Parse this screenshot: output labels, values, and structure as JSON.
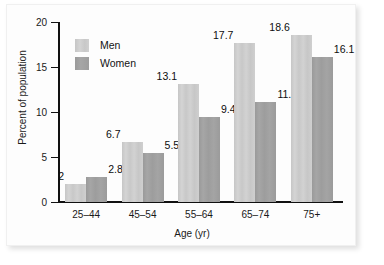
{
  "chart_data": {
    "type": "bar",
    "title": "",
    "subtitle": "",
    "xlabel": "Age (yr)",
    "ylabel": "Percent of population",
    "categories": [
      "25–44",
      "45–54",
      "55–64",
      "65–74",
      "75+"
    ],
    "series": [
      {
        "name": "Men",
        "color": "#cdcdcd",
        "values": [
          2,
          6.7,
          13.1,
          17.7,
          18.6
        ],
        "labels": [
          "2",
          "6.7",
          "13.1",
          "17.7",
          "18.6"
        ]
      },
      {
        "name": "Women",
        "color": "#a0a0a0",
        "values": [
          2.8,
          5.5,
          9.4,
          11.1,
          16.1
        ],
        "labels": [
          "2.8",
          "5.5",
          "9.4",
          "11.1",
          "16.1"
        ]
      }
    ],
    "ylim": [
      0,
      20
    ],
    "yticks": [
      0,
      5,
      10,
      15,
      20
    ],
    "ytick_labels": [
      "0",
      "5",
      "10",
      "15",
      "20"
    ],
    "grid": false,
    "legend_position": "top-left-inside",
    "legend_entries": [
      "Men",
      "Women"
    ]
  }
}
